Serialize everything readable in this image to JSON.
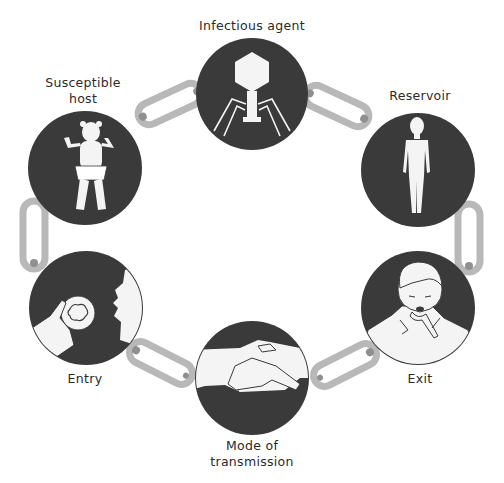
{
  "diagram": {
    "colors": {
      "circle": "#3b3a3b",
      "figure": "#f4f4f4",
      "link": "#b8b8b8",
      "link_shadow": "#8f8f8f",
      "text": "#2a2a2a"
    },
    "nodes": [
      {
        "id": "infectious-agent",
        "label": "Infectious agent",
        "icon": "bacteriophage-icon"
      },
      {
        "id": "reservoir",
        "label": "Reservoir",
        "icon": "human-figure-icon"
      },
      {
        "id": "exit",
        "label": "Exit",
        "icon": "coughing-boy-icon"
      },
      {
        "id": "mode-of-transmission",
        "label_line1": "Mode of",
        "label_line2": "transmission",
        "icon": "handshake-icon"
      },
      {
        "id": "entry",
        "label": "Entry",
        "icon": "hand-apple-mouth-icon"
      },
      {
        "id": "susceptible-host",
        "label_line1": "Susceptible",
        "label_line2": "host",
        "icon": "baby-icon"
      }
    ]
  }
}
